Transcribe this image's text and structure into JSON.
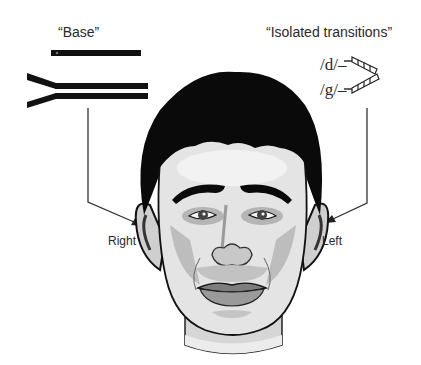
{
  "figure": {
    "labels": {
      "base_title": "“Base”",
      "isolated_title": "“Isolated transitions”",
      "phoneme_d": "/d/–",
      "phoneme_g": "/g/–",
      "right_ear": "Right",
      "left_ear": "Left"
    },
    "panels": [
      {
        "name": "base",
        "description": "single horizontal bar above a branching (Y-shaped) double bar",
        "routed_to": "Right"
      },
      {
        "name": "isolated-transitions",
        "description": "two short hatched formant transitions for /d/ and /g/ converging",
        "routed_to": "Left"
      }
    ],
    "colors": {
      "ink": "#111111",
      "text": "#2a2a2a",
      "line": "#333333",
      "hair": "#0a0a0a",
      "skin_light": "#e6e6e6",
      "skin_mid": "#bdbdbd",
      "skin_dark": "#8a8a8a",
      "background": "#ffffff"
    }
  }
}
